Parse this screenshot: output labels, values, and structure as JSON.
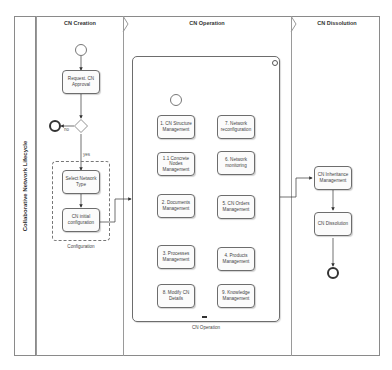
{
  "pool": {
    "label": "Collaborative Network Lifecycle"
  },
  "lanes": [
    {
      "title": "CN Creation"
    },
    {
      "title": "CN Operation"
    },
    {
      "title": "CN Dissolution"
    }
  ],
  "creation": {
    "request_task": "Request. CN Approval",
    "gateway_no_label": "no",
    "gateway_yes_label": "yes",
    "select_type_task": "Select Network Type",
    "initial_config_task": "CN initial configuration",
    "group_label": "Configuration"
  },
  "operation": {
    "subprocess_label": "CN Operation",
    "collapse_marker": "▬",
    "tasks": [
      {
        "id": "t1",
        "label": "1. CN Structure Management"
      },
      {
        "id": "t11",
        "label": "1.1 Concrete Nodes Management"
      },
      {
        "id": "t2",
        "label": "2. Documents Management"
      },
      {
        "id": "t3",
        "label": "3. Processes Management"
      },
      {
        "id": "t4",
        "label": "4. Products Management"
      },
      {
        "id": "t5",
        "label": "5. CN Orders Management"
      },
      {
        "id": "t6",
        "label": "6. Network monitoring"
      },
      {
        "id": "t7",
        "label": "7. Network reconfiguration"
      },
      {
        "id": "t8",
        "label": "8. Modify CN Details"
      },
      {
        "id": "t9",
        "label": "9. Knowledge Management"
      }
    ]
  },
  "dissolution": {
    "inheritance_task": "CN Inheritance Management",
    "dissolution_task": "CN Dissolution"
  }
}
